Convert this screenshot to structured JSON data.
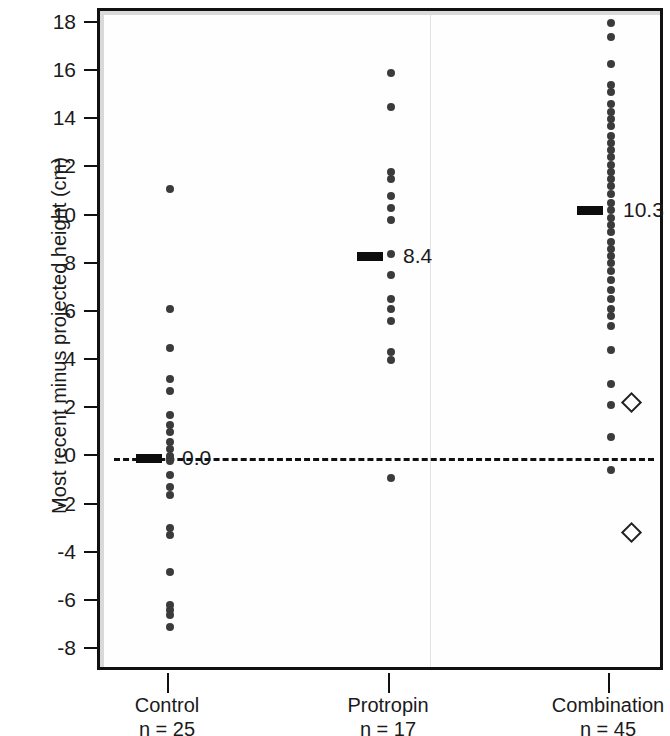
{
  "chart_data": {
    "type": "scatter",
    "title": "",
    "subtitle": "",
    "xlabel": "",
    "ylabel": "Most recent minus projected height (cm)",
    "ylim": [
      -8.8,
      18.8
    ],
    "yticks": [
      18,
      16,
      14,
      12,
      10,
      8,
      6,
      4,
      2,
      0,
      -2,
      -4,
      -6,
      -8
    ],
    "ytick_labels": [
      "18",
      "16",
      "14",
      "12",
      "10",
      "8",
      "6",
      "4",
      "2",
      "0",
      "-2",
      "-4",
      "-6",
      "-8"
    ],
    "grid": false,
    "legend": "none",
    "reference_line": {
      "y": 0,
      "style": "dashed",
      "label": ""
    },
    "categories": [
      "Control",
      "Protropin",
      "Combination"
    ],
    "groups": [
      {
        "name": "Control",
        "n_label": "n = 25",
        "n": 25,
        "mean": 0.0,
        "mean_label": "0.0",
        "values": [
          11.2,
          6.2,
          4.6,
          3.3,
          2.8,
          1.8,
          1.4,
          1.1,
          0.7,
          0.4,
          0.1,
          0.0,
          -0.1,
          -0.7,
          -1.2,
          -1.5,
          -2.9,
          -3.2,
          -4.7,
          -6.1,
          -6.3,
          -6.5,
          -7.0
        ],
        "special_values": []
      },
      {
        "name": "Protropin",
        "n_label": "n = 17",
        "n": 17,
        "mean": 8.4,
        "mean_label": "8.4",
        "values": [
          16.0,
          14.6,
          11.9,
          11.6,
          10.9,
          10.4,
          9.9,
          8.5,
          7.6,
          6.6,
          6.2,
          5.7,
          4.4,
          4.1,
          -0.8
        ],
        "special_values": []
      },
      {
        "name": "Combination",
        "n_label": "n = 45",
        "n": 45,
        "mean": 10.3,
        "mean_label": "10.3",
        "values": [
          18.1,
          17.5,
          16.4,
          15.5,
          15.2,
          14.7,
          14.4,
          14.1,
          13.8,
          13.4,
          13.1,
          12.8,
          12.5,
          12.2,
          11.9,
          11.6,
          11.3,
          11.0,
          10.6,
          10.3,
          10.0,
          9.7,
          9.4,
          9.0,
          8.7,
          8.4,
          8.1,
          7.8,
          7.4,
          7.0,
          6.6,
          6.2,
          5.9,
          5.5,
          4.5,
          3.1,
          2.2,
          0.9,
          -0.5
        ],
        "special_values": [
          2.4,
          -3.0
        ]
      }
    ],
    "special_marker": "open-diamond",
    "point_marker": "filled-circle"
  }
}
